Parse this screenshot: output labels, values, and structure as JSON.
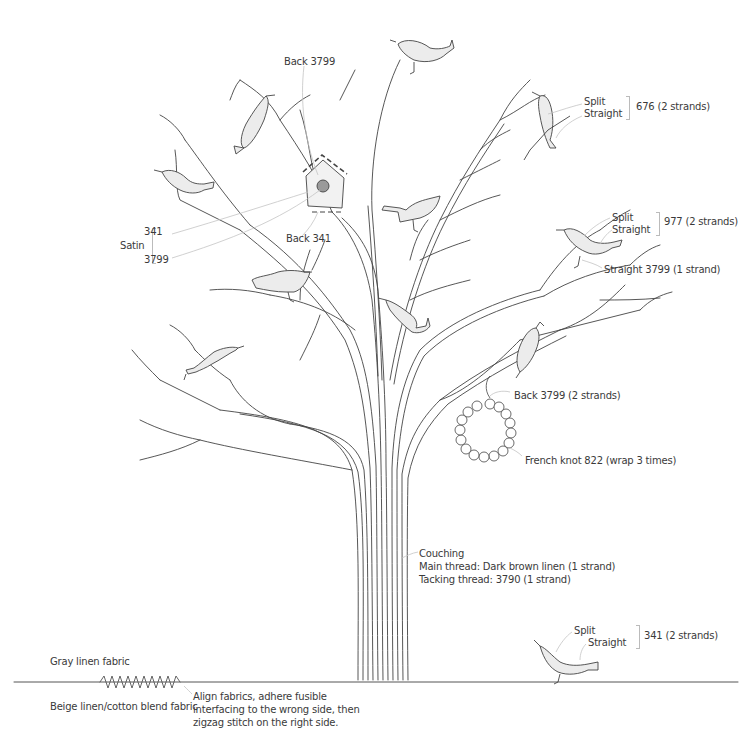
{
  "diagram": {
    "colors": {
      "line": "#444444",
      "leader": "#bbbbbb",
      "bird_fill": "#ececec",
      "house_fill": "#f2f2f2",
      "hole_fill": "#9a9a9a"
    }
  },
  "labels": {
    "birdhouse_back_top": "Back 3799",
    "birdhouse_back_bottom": "Back 341",
    "satin_title": "Satin",
    "satin_341": "341",
    "satin_3799": "3799",
    "bird_676_split": "Split",
    "bird_676_straight": "Straight",
    "bird_676_thread": "676 (2 strands)",
    "bird_977_split": "Split",
    "bird_977_straight": "Straight",
    "bird_977_thread": "977 (2 strands)",
    "bird_977_legs": "Straight 3799 (1 strand)",
    "wreath_hanger": "Back 3799 (2 strands)",
    "wreath_knots": "French knot 822 (wrap 3 times)",
    "trunk_line1": "Couching",
    "trunk_line2": "Main thread: Dark brown linen (1 strand)",
    "trunk_line3": "Tacking thread: 3790 (1 strand)",
    "ground_bird_split": "Split",
    "ground_bird_straight": "Straight",
    "ground_bird_thread": "341 (2 strands)",
    "fabric_top": "Gray linen fabric",
    "fabric_bottom": "Beige linen/cotton blend fabric",
    "seam_note": "Align fabrics, adhere fusible interfacing to the wrong side, then zigzag stitch on the right side."
  }
}
